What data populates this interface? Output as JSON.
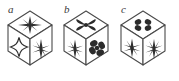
{
  "figure": {
    "background_color": "#ffffff",
    "line_color": "#4a4a4a",
    "fill_color": "#2e2e2e",
    "count": 3
  },
  "cubes": [
    {
      "label": "a",
      "label_x": 8,
      "label_y": 4,
      "origin_x": 4,
      "faces": {
        "top": {
          "symbol": "starburst-many-rays",
          "name": "eight-ray-starburst"
        },
        "left": {
          "symbol": "four-pointed-star-outline",
          "name": "four-pointed-star"
        },
        "right": {
          "symbol": "asterisk-snowflake",
          "name": "six-ray-asterisk"
        }
      }
    },
    {
      "label": "b",
      "label_x": 64,
      "label_y": 4,
      "origin_x": 60,
      "faces": {
        "top": {
          "symbol": "filled-x-propeller",
          "name": "four-blade-cross"
        },
        "left": {
          "symbol": "asterisk-snowflake",
          "name": "six-ray-asterisk"
        },
        "right": {
          "symbol": "filled-four-petal-clover",
          "name": "four-petal-clover"
        }
      }
    },
    {
      "label": "c",
      "label_x": 121,
      "label_y": 4,
      "origin_x": 117,
      "faces": {
        "top": {
          "symbol": "four-dot-cluster",
          "name": "four-dot-clover"
        },
        "left": {
          "symbol": "asterisk-snowflake",
          "name": "six-ray-asterisk"
        },
        "right": {
          "symbol": "asterisk-snowflake",
          "name": "six-ray-asterisk"
        }
      }
    }
  ]
}
